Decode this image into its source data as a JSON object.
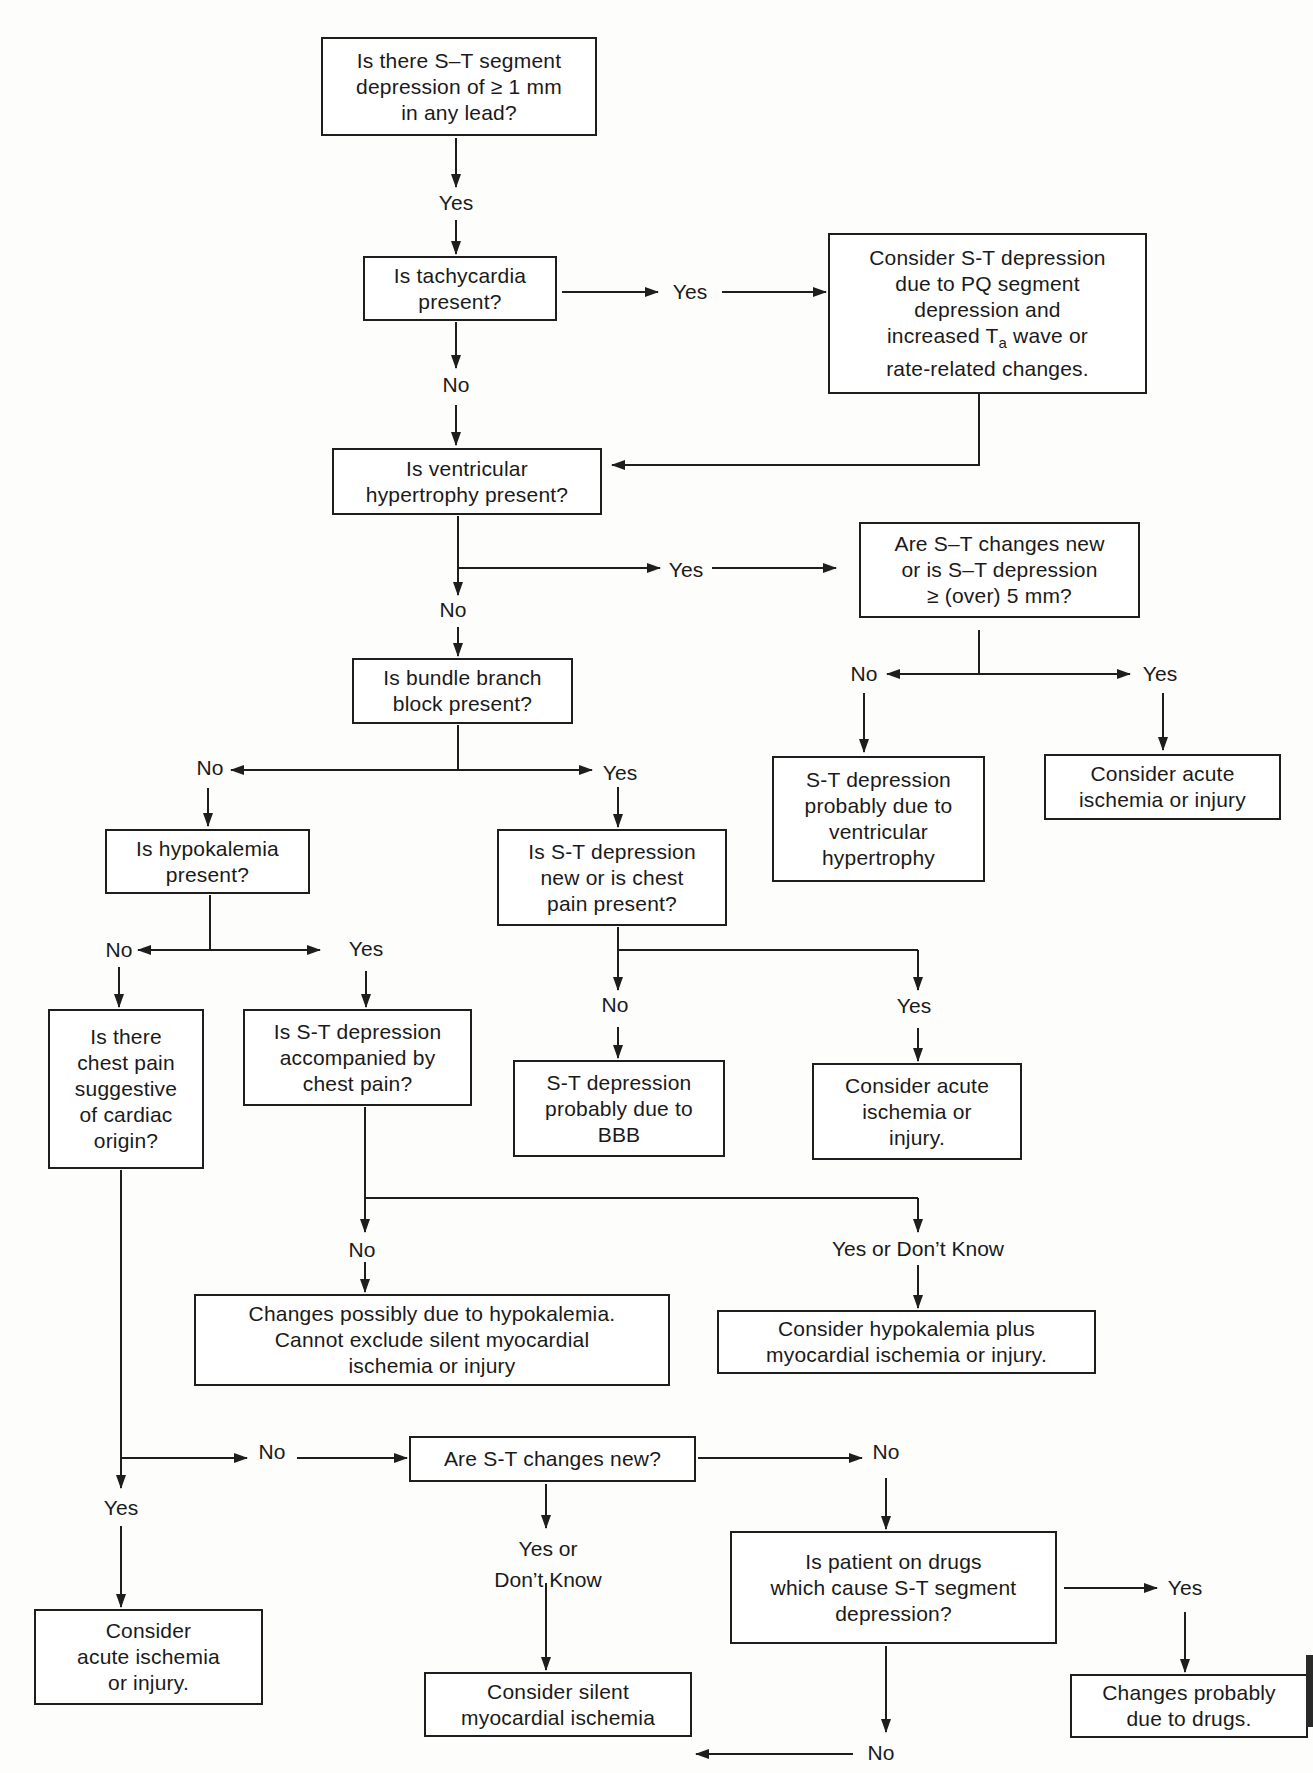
{
  "diagram": {
    "colors": {
      "line": "#1e1e1e",
      "text": "#1a1a1a",
      "background": "#ffffff"
    },
    "nodes": {
      "start": "Is there S–T segment\ndepression of ≥ 1 mm\nin any lead?",
      "tachycardia": "Is tachycardia\npresent?",
      "pq_depression": "Consider S-T depression\ndue to PQ segment\ndepression and",
      "pq_depression_line4_pre": "increased T",
      "pq_depression_sub": "a",
      "pq_depression_line4_post": " wave or",
      "pq_depression_line5": "rate-related changes.",
      "ventricular_hypertrophy": "Is ventricular\nhypertrophy present?",
      "st_changes_new_or_5mm": "Are S–T changes new\nor is S–T depression\n≥ (over) 5 mm?",
      "bundle_branch": "Is bundle branch\nblock present?",
      "st_due_to_vh": "S-T depression\nprobably due to\nventricular\nhypertrophy",
      "acute_ischemia_1": "Consider acute\nischemia or injury",
      "hypokalemia": "Is hypokalemia\npresent?",
      "st_new_or_chest_pain": "Is S-T depression\nnew or is chest\npain present?",
      "chest_pain_cardiac": "Is there\nchest pain\nsuggestive\nof cardiac\norigin?",
      "st_accompanied_chest_pain": "Is S-T depression\naccompanied by\nchest pain?",
      "st_due_to_bbb": "S-T depression\nprobably due to\nBBB",
      "acute_ischemia_2": "Consider acute\nischemia or\ninjury.",
      "hypokalemia_possible": "Changes possibly due to hypokalemia.\nCannot exclude silent myocardial\nischemia or injury",
      "hypokalemia_plus_ischemia": "Consider hypokalemia plus\nmyocardial ischemia or injury.",
      "st_changes_new": "Are S-T changes new?",
      "acute_ischemia_3": "Consider\nacute ischemia\nor injury.",
      "drugs_question": "Is patient on drugs\nwhich cause S-T segment\ndepression?",
      "silent_ischemia": "Consider silent\nmyocardial ischemia",
      "due_to_drugs": "Changes probably\ndue to drugs."
    },
    "labels": {
      "start_yes": "Yes",
      "tachy_yes": "Yes",
      "tachy_no": "No",
      "vh_yes": "Yes",
      "vh_no": "No",
      "new5_no": "No",
      "new5_yes": "Yes",
      "bbb_no": "No",
      "bbb_yes": "Yes",
      "hypo_no": "No",
      "hypo_yes": "Yes",
      "newcp_no": "No",
      "newcp_yes": "Yes",
      "accomp_no": "No",
      "accomp_yes": "Yes or Don’t Know",
      "cardiac_no": "No",
      "cardiac_yes": "Yes",
      "stnew_no": "No",
      "stnew_yes": "Yes  or\nDon’t Know",
      "drugs_yes": "Yes",
      "drugs_no": "No"
    }
  }
}
